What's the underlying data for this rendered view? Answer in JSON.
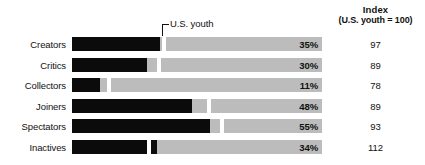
{
  "header": {
    "index_title": "Index",
    "index_subtitle": "(U.S. youth = 100)"
  },
  "callout": {
    "label": "U.S. youth",
    "icon": "elbow-pointer-icon"
  },
  "chart_data": {
    "type": "bar",
    "title": "",
    "subtitle": "",
    "xlabel": "",
    "ylabel": "",
    "xlim": [
      0,
      100
    ],
    "grid": false,
    "legend": "none",
    "orientation": "horizontal",
    "categories": [
      "Creators",
      "Critics",
      "Collectors",
      "Joiners",
      "Spectators",
      "Inactives"
    ],
    "series": [
      {
        "name": "Percent",
        "values": [
          35,
          30,
          11,
          48,
          55,
          34
        ]
      },
      {
        "name": "Index (U.S. youth = 100)",
        "values": [
          97,
          89,
          78,
          89,
          93,
          112
        ]
      },
      {
        "name": "U.S. youth benchmark",
        "values": [
          36,
          34,
          14,
          54,
          59,
          30
        ]
      }
    ],
    "value_labels": [
      "35%",
      "30%",
      "11%",
      "48%",
      "55%",
      "34%"
    ],
    "index_labels": [
      "97",
      "89",
      "78",
      "89",
      "93",
      "112"
    ],
    "annotations": [
      {
        "text": "U.S. youth",
        "points_to": "benchmark-marker-row-1"
      }
    ],
    "colors": {
      "bar_fill": "#0b0b0b",
      "track": "#bcbcbc",
      "marker": "#ffffff",
      "text": "#111111",
      "background": "#ffffff"
    }
  },
  "rows": [
    {
      "label": "Creators",
      "pct": "35%",
      "index": "97",
      "fill": 35,
      "marker": 36
    },
    {
      "label": "Critics",
      "pct": "30%",
      "index": "89",
      "fill": 30,
      "marker": 34
    },
    {
      "label": "Collectors",
      "pct": "11%",
      "index": "78",
      "fill": 11,
      "marker": 14
    },
    {
      "label": "Joiners",
      "pct": "48%",
      "index": "89",
      "fill": 48,
      "marker": 54
    },
    {
      "label": "Spectators",
      "pct": "55%",
      "index": "93",
      "fill": 55,
      "marker": 59
    },
    {
      "label": "Inactives",
      "pct": "34%",
      "index": "112",
      "fill": 34,
      "marker": 30
    }
  ]
}
